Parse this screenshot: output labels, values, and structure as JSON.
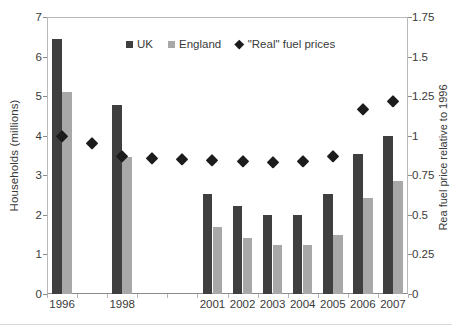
{
  "chart_data": {
    "type": "bar",
    "title": "",
    "xlabel": "",
    "ylabel": "Households (millions)",
    "y2label": "Rea  fuel price relative to 1996",
    "categories": [
      "1996",
      "1997",
      "1998",
      "1999",
      "2000",
      "2001",
      "2002",
      "2003",
      "2004",
      "2005",
      "2006",
      "2007"
    ],
    "visible_tick_labels": [
      "1996",
      "",
      "1998",
      "",
      "",
      "2001",
      "2002",
      "2003",
      "2004",
      "2005",
      "2006",
      "2007"
    ],
    "ylim": [
      0,
      7
    ],
    "y2lim": [
      0,
      1.75
    ],
    "yticks": [
      "0",
      "1",
      "2",
      "3",
      "4",
      "5",
      "6",
      "7"
    ],
    "y2ticks": [
      "0",
      "0.25",
      "0.5",
      "0.75",
      "1",
      "1.25",
      "1.5",
      "1.75"
    ],
    "grid": false,
    "legend_position": "top-center",
    "series": [
      {
        "name": "UK",
        "type": "bar",
        "axis": "left",
        "color": "#3f3f3f",
        "values": [
          6.45,
          null,
          4.78,
          null,
          null,
          2.52,
          2.23,
          2.0,
          2.0,
          2.54,
          3.55,
          4.0
        ]
      },
      {
        "name": "England",
        "type": "bar",
        "axis": "left",
        "color": "#a8a8a8",
        "values": [
          5.1,
          null,
          3.45,
          null,
          null,
          1.7,
          1.42,
          1.23,
          1.23,
          1.5,
          2.42,
          2.85
        ]
      },
      {
        "name": "\"Real\" fuel prices",
        "type": "scatter",
        "axis": "right",
        "color": "#1c1c1c",
        "marker": "diamond",
        "values": [
          1.0,
          0.955,
          0.875,
          0.86,
          0.855,
          0.845,
          0.84,
          0.833,
          0.84,
          0.87,
          1.17,
          1.22
        ]
      }
    ]
  },
  "axes": {
    "left_title": "Households (millions)",
    "right_title": "Rea  fuel price relative to 1996"
  },
  "legend": {
    "items": [
      {
        "label": "UK",
        "marker": "square",
        "color": "#3f3f3f"
      },
      {
        "label": "England",
        "marker": "square",
        "color": "#a8a8a8"
      },
      {
        "label": "\"Real\" fuel prices",
        "marker": "diamond",
        "color": "#1c1c1c"
      }
    ]
  },
  "colors": {
    "uk_bar": "#3f3f3f",
    "england_bar": "#a8a8a8",
    "diamond": "#1c1c1c",
    "axis_line": "#b9b9b9",
    "text": "#3a3a3a"
  }
}
